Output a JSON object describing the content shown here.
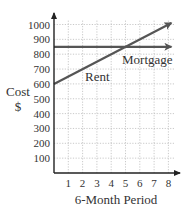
{
  "chart_data": {
    "type": "line",
    "title": "",
    "xlabel": "6-Month Period",
    "ylabel": [
      "Cost",
      "$"
    ],
    "x_ticks": [
      "1",
      "2",
      "3",
      "4",
      "5",
      "6",
      "7",
      "8"
    ],
    "y_ticks": [
      "100",
      "200",
      "300",
      "400",
      "500",
      "600",
      "700",
      "800",
      "900",
      "1000"
    ],
    "xlim": [
      0,
      8
    ],
    "ylim": [
      0,
      1000
    ],
    "grid": true,
    "grid_style": "dotted",
    "legend": "inline labels",
    "series": [
      {
        "name": "Rent",
        "x": [
          0,
          1,
          2,
          3,
          4,
          5,
          6,
          7,
          8
        ],
        "values": [
          600,
          650,
          700,
          750,
          800,
          850,
          900,
          950,
          1000
        ],
        "color": "#555555",
        "arrow_end": true
      },
      {
        "name": "Mortgage",
        "x": [
          0,
          1,
          2,
          3,
          4,
          5,
          6,
          7,
          8
        ],
        "values": [
          850,
          850,
          850,
          850,
          850,
          850,
          850,
          850,
          850
        ],
        "color": "#555555",
        "arrow_end": true
      }
    ],
    "annotations": []
  },
  "colors": {
    "axis": "#222222",
    "grid": "#bbbbbb",
    "line": "#555555",
    "text": "#333333"
  }
}
